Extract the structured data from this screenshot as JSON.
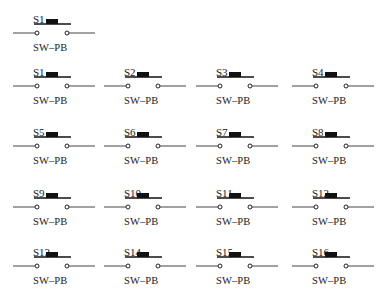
{
  "diagram": {
    "type": "schematic-symbols",
    "component_type": "push-button switch",
    "standalone": {
      "ref": "S1",
      "value": "SW–PB"
    },
    "grid": {
      "rows": 4,
      "cols": 4,
      "components": [
        {
          "ref": "S1",
          "value": "SW–PB"
        },
        {
          "ref": "S2",
          "value": "SW–PB"
        },
        {
          "ref": "S3",
          "value": "SW–PB"
        },
        {
          "ref": "S4",
          "value": "SW–PB"
        },
        {
          "ref": "S5",
          "value": "SW–PB"
        },
        {
          "ref": "S6",
          "value": "SW–PB"
        },
        {
          "ref": "S7",
          "value": "SW–PB"
        },
        {
          "ref": "S8",
          "value": "SW–PB"
        },
        {
          "ref": "S9",
          "value": "SW–PB"
        },
        {
          "ref": "S10",
          "value": "SW–PB"
        },
        {
          "ref": "S11",
          "value": "SW–PB"
        },
        {
          "ref": "S12",
          "value": "SW–PB"
        },
        {
          "ref": "S13",
          "value": "SW–PB"
        },
        {
          "ref": "S14",
          "value": "SW–PB"
        },
        {
          "ref": "S15",
          "value": "SW–PB"
        },
        {
          "ref": "S16",
          "value": "SW–PB"
        }
      ]
    },
    "colors": {
      "line": "#333333",
      "button": "#111111",
      "background": "#ffffff"
    }
  }
}
